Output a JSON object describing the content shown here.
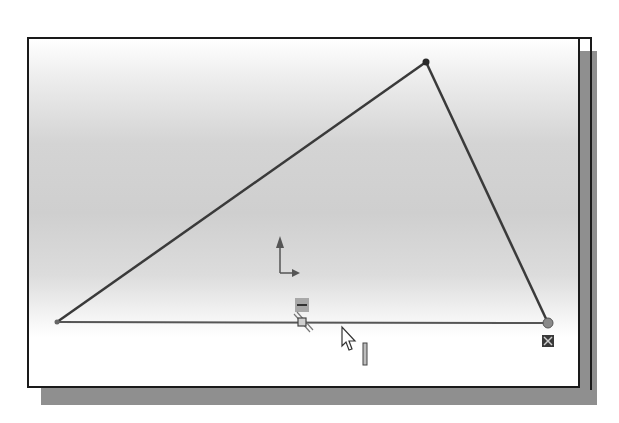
{
  "app": {
    "type": "2D sketch viewport",
    "description": "Triangle sketch with origin axes, horizontal relation glyph, coincident marker and mouse cursor"
  },
  "sketch": {
    "vertices": [
      {
        "name": "left-vertex",
        "x": 57,
        "y": 322
      },
      {
        "name": "top-vertex",
        "x": 426,
        "y": 62
      },
      {
        "name": "right-vertex",
        "x": 548,
        "y": 323
      }
    ],
    "lines": [
      {
        "name": "left-edge",
        "from": "left-vertex",
        "to": "top-vertex"
      },
      {
        "name": "right-edge",
        "from": "top-vertex",
        "to": "right-vertex"
      },
      {
        "name": "base-edge",
        "from": "left-vertex",
        "to": "right-vertex"
      }
    ],
    "line_color": "#3a3a3a",
    "origin": {
      "x": 280,
      "y": 273
    }
  },
  "markers": {
    "horizontal_relation": {
      "x": 302,
      "y": 305
    },
    "midpoint": {
      "x": 302,
      "y": 322
    },
    "coincident": {
      "x": 548,
      "y": 340
    },
    "cursor": {
      "x": 342,
      "y": 327
    },
    "inference_bar": {
      "x": 365,
      "y": 344
    }
  },
  "colors": {
    "frame_border": "#1a1a1a",
    "shadow": "#8f8f8f",
    "sketch_line": "#3a3a3a"
  }
}
